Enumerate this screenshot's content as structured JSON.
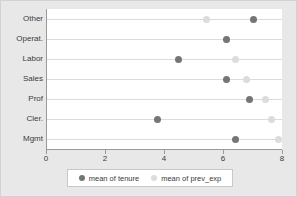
{
  "chart_data": {
    "type": "scatter",
    "title": "",
    "xlabel": "",
    "ylabel": "",
    "xlim": [
      0,
      8
    ],
    "xticks": [
      0,
      2,
      4,
      6,
      8
    ],
    "xticklabels": [
      "0",
      "2",
      "4",
      "6",
      "8"
    ],
    "grid": true,
    "orientation": "horizontal",
    "legend_position": "bottom",
    "categories": [
      "Other",
      "Operat.",
      "Labor",
      "Sales",
      "Prof",
      "Cler.",
      "Mgmt"
    ],
    "series": [
      {
        "name": "mean of tenure",
        "color": "#757575",
        "values": [
          7.0,
          6.1,
          4.45,
          6.1,
          6.85,
          3.75,
          6.4
        ]
      },
      {
        "name": "mean of prev_exp",
        "color": "#dcdcdc",
        "values": [
          5.4,
          6.1,
          6.4,
          6.75,
          7.4,
          7.6,
          7.85
        ]
      }
    ]
  },
  "legend": {
    "entries": [
      {
        "label": "mean of tenure",
        "marker": "filled-circle-dark"
      },
      {
        "label": "mean of prev_exp",
        "marker": "filled-circle-light"
      }
    ]
  },
  "colors": {
    "figure_background": "#e8e8e8",
    "plot_background": "#ffffff",
    "gridline": "#dcdcdc",
    "axis": "#9a9a9a",
    "text": "#3b3b3b",
    "series_tenure": "#757575",
    "series_prev_exp": "#dcdcdc"
  }
}
